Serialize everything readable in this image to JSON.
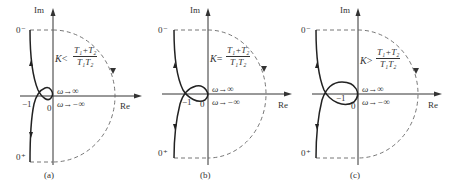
{
  "figure": {
    "panels": [
      {
        "id": "a",
        "caption": "(a)",
        "axis_im": "Im",
        "axis_re": "Re",
        "label_0minus": "0⁻",
        "label_0plus": "0⁺",
        "label_neg1": "−1",
        "label_origin": "0",
        "omega_pos": "ω→∞",
        "omega_neg": "ω→−∞",
        "condition_K": "K",
        "condition_op": "<",
        "frac_num": "T₁+T₂",
        "frac_den": "T₁T₂"
      },
      {
        "id": "b",
        "caption": "(b)",
        "axis_im": "Im",
        "axis_re": "Re",
        "label_0minus": "0⁻",
        "label_0plus": "0⁺",
        "label_neg1": "−1",
        "label_origin": "0",
        "omega_pos": "ω→∞",
        "omega_neg": "ω→−∞",
        "condition_K": "K",
        "condition_op": "=",
        "frac_num": "T₁+T₂",
        "frac_den": "T₁T₂"
      },
      {
        "id": "c",
        "caption": "(c)",
        "axis_im": "Im",
        "axis_re": "Re",
        "label_0minus": "0⁻",
        "label_0plus": "0⁺",
        "label_neg1": "−1",
        "label_origin": "0",
        "omega_pos": "ω→∞",
        "omega_neg": "ω→−∞",
        "condition_K": "K",
        "condition_op": ">",
        "frac_num": "T₁+T₂",
        "frac_den": "T₁T₂"
      }
    ]
  }
}
